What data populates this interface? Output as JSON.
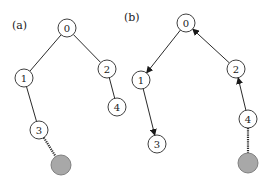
{
  "panels": {
    "a": {
      "label": "(a)",
      "nodes": [
        {
          "id": "0",
          "text": "0",
          "x": 67,
          "y": 28
        },
        {
          "id": "1",
          "text": "1",
          "x": 24,
          "y": 78
        },
        {
          "id": "2",
          "text": "2",
          "x": 107,
          "y": 69
        },
        {
          "id": "3",
          "text": "3",
          "x": 39,
          "y": 130
        },
        {
          "id": "4",
          "text": "4",
          "x": 117,
          "y": 107
        },
        {
          "id": "g",
          "text": "",
          "x": 61,
          "y": 165,
          "filled": true
        }
      ],
      "edges": [
        {
          "from": "0",
          "to": "1",
          "style": "solid"
        },
        {
          "from": "0",
          "to": "2",
          "style": "solid"
        },
        {
          "from": "1",
          "to": "3",
          "style": "solid"
        },
        {
          "from": "2",
          "to": "4",
          "style": "solid"
        },
        {
          "from": "3",
          "to": "g",
          "style": "dotted"
        }
      ]
    },
    "b": {
      "label": "(b)",
      "nodes": [
        {
          "id": "0",
          "text": "0",
          "x": 186,
          "y": 23
        },
        {
          "id": "1",
          "text": "1",
          "x": 141,
          "y": 80
        },
        {
          "id": "2",
          "text": "2",
          "x": 236,
          "y": 69
        },
        {
          "id": "3",
          "text": "3",
          "x": 157,
          "y": 144
        },
        {
          "id": "4",
          "text": "4",
          "x": 248,
          "y": 119
        },
        {
          "id": "g",
          "text": "",
          "x": 248,
          "y": 163,
          "filled": true
        }
      ],
      "edges": [
        {
          "from": "0",
          "to": "1",
          "style": "arrow"
        },
        {
          "from": "2",
          "to": "0",
          "style": "arrow"
        },
        {
          "from": "1",
          "to": "3",
          "style": "arrow"
        },
        {
          "from": "4",
          "to": "2",
          "style": "arrow"
        },
        {
          "from": "4",
          "to": "g",
          "style": "dotted"
        }
      ]
    }
  },
  "colors": {
    "stroke": "#2a2a2a",
    "node_fill": "#ffffff",
    "filled_node": "#a8a8a8"
  }
}
